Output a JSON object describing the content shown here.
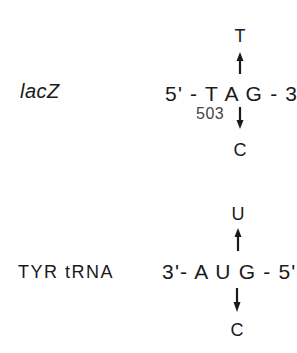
{
  "figure": {
    "panels": [
      {
        "label": "lacZ",
        "sequence": "5' - T A G - 3'",
        "position": "503",
        "mutation_up": "T",
        "mutation_down": "C"
      },
      {
        "label": "TYR tRNA",
        "sequence": "3'- A U G - 5'",
        "mutation_up": "U",
        "mutation_down": "C"
      }
    ],
    "icons": {
      "up": "arrow-up-icon",
      "down": "arrow-down-icon"
    },
    "colors": {
      "ink": "#1a1a1a",
      "background": "#ffffff"
    }
  }
}
